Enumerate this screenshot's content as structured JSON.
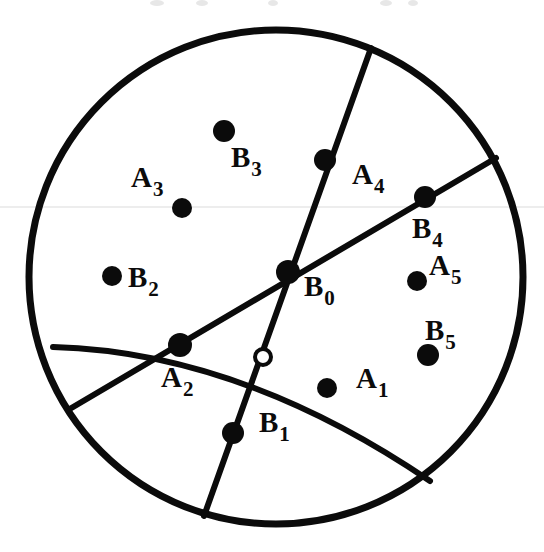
{
  "figure": {
    "kind": "geometric-diagram",
    "title": "",
    "background_color": "#ffffff",
    "ink_color": "#0b0b0b",
    "canvas": {
      "width": 544,
      "height": 552
    }
  },
  "boundary_circle": {
    "name": "boundary-circle",
    "center_x": 276,
    "center_y": 277,
    "radius": 247,
    "stroke_width": 7,
    "fill": "none"
  },
  "curves": [
    {
      "id": "chord-steep",
      "name": "steep-chord",
      "kind": "line",
      "x1": 371,
      "y1": 48,
      "x2": 204,
      "y2": 516,
      "stroke_width": 6
    },
    {
      "id": "chord-shallow",
      "name": "shallow-chord",
      "kind": "line",
      "x1": 496,
      "y1": 158,
      "x2": 68,
      "y2": 410,
      "stroke_width": 6
    },
    {
      "id": "arc-lower",
      "name": "lower-arc",
      "kind": "arc",
      "path": "M 53 347 Q 240 352 430 481",
      "stroke_width": 6
    }
  ],
  "points": [
    {
      "id": "A1",
      "name": "point-a1",
      "label": "A",
      "subscript": "1",
      "marker": "filled",
      "x": 327,
      "y": 388,
      "radius": 10,
      "label_x": 356,
      "label_y": 364
    },
    {
      "id": "A2",
      "name": "point-a2",
      "label": "A",
      "subscript": "2",
      "marker": "filled",
      "x": 180,
      "y": 345,
      "radius": 12,
      "label_x": 161,
      "label_y": 363
    },
    {
      "id": "A3",
      "name": "point-a3",
      "label": "A",
      "subscript": "3",
      "marker": "filled",
      "x": 182,
      "y": 208,
      "radius": 10,
      "label_x": 131,
      "label_y": 163
    },
    {
      "id": "A4",
      "name": "point-a4",
      "label": "A",
      "subscript": "4",
      "marker": "filled",
      "x": 325,
      "y": 160,
      "radius": 11,
      "label_x": 352,
      "label_y": 160
    },
    {
      "id": "A5",
      "name": "point-a5",
      "label": "A",
      "subscript": "5",
      "marker": "filled",
      "x": 417,
      "y": 281,
      "radius": 10,
      "label_x": 429,
      "label_y": 251
    },
    {
      "id": "B0",
      "name": "point-b0",
      "label": "B",
      "subscript": "0",
      "marker": "filled",
      "x": 288,
      "y": 272,
      "radius": 12,
      "label_x": 304,
      "label_y": 272
    },
    {
      "id": "B1",
      "name": "point-b1",
      "label": "B",
      "subscript": "1",
      "marker": "filled",
      "x": 233,
      "y": 433,
      "radius": 11,
      "label_x": 259,
      "label_y": 408
    },
    {
      "id": "B2",
      "name": "point-b2",
      "label": "B",
      "subscript": "2",
      "marker": "filled",
      "x": 112,
      "y": 276,
      "radius": 10,
      "label_x": 128,
      "label_y": 263
    },
    {
      "id": "B3",
      "name": "point-b3",
      "label": "B",
      "subscript": "3",
      "marker": "filled",
      "x": 224,
      "y": 131,
      "radius": 11,
      "label_x": 231,
      "label_y": 143
    },
    {
      "id": "B4",
      "name": "point-b4",
      "label": "B",
      "subscript": "4",
      "marker": "filled",
      "x": 425,
      "y": 197,
      "radius": 11,
      "label_x": 412,
      "label_y": 214
    },
    {
      "id": "B5",
      "name": "point-b5",
      "label": "B",
      "subscript": "5",
      "marker": "filled",
      "x": 428,
      "y": 355,
      "radius": 11,
      "label_x": 425,
      "label_y": 316
    },
    {
      "id": "hollow",
      "name": "point-hollow-intersection",
      "label": "",
      "subscript": "",
      "marker": "hollow",
      "x": 263,
      "y": 357,
      "radius": 8,
      "label_x": 0,
      "label_y": 0
    }
  ],
  "artifacts": {
    "note": "scan smudges along the top edge and a faint horizontal scan band",
    "smudges": [
      {
        "x": 150,
        "y": 0,
        "w": 14,
        "h": 6
      },
      {
        "x": 196,
        "y": 0,
        "w": 12,
        "h": 6
      },
      {
        "x": 268,
        "y": 0,
        "w": 10,
        "h": 6
      },
      {
        "x": 380,
        "y": 0,
        "w": 12,
        "h": 6
      },
      {
        "x": 408,
        "y": 0,
        "w": 10,
        "h": 6
      }
    ],
    "band": {
      "y": 206,
      "h": 2
    }
  }
}
